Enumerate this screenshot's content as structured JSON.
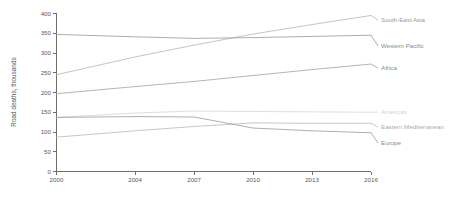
{
  "chart_data": {
    "type": "line",
    "title": "",
    "subtitle": "",
    "xlabel": "",
    "ylabel": "Road deaths, thousands",
    "x": [
      2000,
      2004,
      2007,
      2010,
      2013,
      2016
    ],
    "xlim": [
      2000,
      2016
    ],
    "ylim": [
      0,
      400
    ],
    "y_ticks": [
      0,
      50,
      100,
      150,
      200,
      250,
      300,
      350,
      400
    ],
    "x_ticks": [
      "2000",
      "2004",
      "2007",
      "2010",
      "2013",
      "2016"
    ],
    "grid": false,
    "legend_position": "inline-right",
    "series": [
      {
        "name": "South-East Asia",
        "color": "#b9b9b9",
        "label_color": "#9a9a9a",
        "values": [
          245,
          290,
          320,
          348,
          372,
          395
        ]
      },
      {
        "name": "Western Pacific",
        "color": "#9e9e9e",
        "label_color": "#8a8a8a",
        "values": [
          347,
          341,
          337,
          339,
          342,
          345
        ]
      },
      {
        "name": "Africa",
        "color": "#a8a8a8",
        "label_color": "#8a8a8a",
        "values": [
          197,
          215,
          228,
          243,
          258,
          272
        ]
      },
      {
        "name": "Americas",
        "color": "#d8d8d8",
        "label_color": "#d2d2d2",
        "values": [
          137,
          148,
          153,
          152,
          151,
          150
        ]
      },
      {
        "name": "Eastern Mediterranean",
        "color": "#bdbdbd",
        "label_color": "#aaaaaa",
        "values": [
          87,
          103,
          114,
          123,
          122,
          122
        ]
      },
      {
        "name": "Europe",
        "color": "#a0a0a0",
        "label_color": "#8a8a8a",
        "values": [
          137,
          139,
          138,
          110,
          103,
          98
        ]
      }
    ]
  },
  "axis": {
    "y_title": "Road deaths, thousands"
  }
}
